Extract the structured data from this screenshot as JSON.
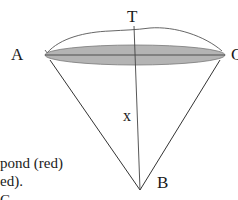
{
  "labels": {
    "A": "A",
    "C": "C",
    "T": "T",
    "B": "B",
    "x": "x"
  },
  "caption_fragments": [
    "pond (red)",
    "ed).",
    "C"
  ],
  "colors": {
    "pond_fill": "#b4b4b4",
    "pond_stroke": "#777777",
    "line": "#333333",
    "arc": "#555555"
  },
  "geometry": {
    "A": [
      45,
      55
    ],
    "C": [
      225,
      55
    ],
    "T_top": [
      133,
      18
    ],
    "B": [
      140,
      190
    ],
    "ellipse": {
      "cx": 135,
      "cy": 55,
      "rx": 90,
      "ry": 10
    }
  }
}
